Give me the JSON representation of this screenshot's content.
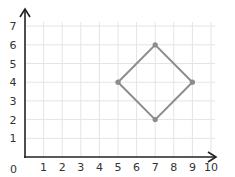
{
  "chart_data": {
    "type": "scatter",
    "title": "",
    "xlabel": "",
    "ylabel": "",
    "xlim": [
      0,
      10
    ],
    "ylim": [
      0,
      7
    ],
    "grid": true,
    "x_ticks": [
      "1",
      "2",
      "3",
      "4",
      "5",
      "6",
      "7",
      "8",
      "9",
      "10"
    ],
    "y_ticks": [
      "1",
      "2",
      "3",
      "4",
      "5",
      "6",
      "7"
    ],
    "origin_label": "0",
    "series": [
      {
        "name": "quadrilateral",
        "closed": true,
        "points": [
          [
            5,
            4
          ],
          [
            7,
            6
          ],
          [
            9,
            4
          ],
          [
            7,
            2
          ]
        ]
      }
    ]
  },
  "colors": {
    "grid": "#e4e4e4",
    "axis": "#222222",
    "shape": "#8c8c8c",
    "point": "#8c8c8c"
  }
}
